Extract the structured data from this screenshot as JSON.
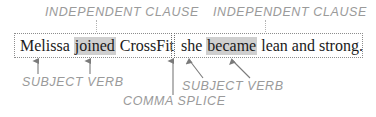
{
  "diagram": {
    "accent_color": "#9a9a9a",
    "highlight_color": "#cfcfcf",
    "text_color": "#1a1a1a"
  },
  "labels": {
    "independent_clause_left": "INDEPENDENT CLAUSE",
    "independent_clause_right": "INDEPENDENT CLAUSE",
    "subject_verb_left": "SUBJECT VERB",
    "subject_verb_right": "SUBJECT VERB",
    "comma_splice": "COMMA SPLICE"
  },
  "sentence": {
    "clause_left": {
      "subject": "Melissa",
      "verb": "joined",
      "rest": "CrossFit",
      "full": "Melissa joined CrossFit"
    },
    "clause_right": {
      "subject": "she",
      "verb": "became",
      "rest": "lean and strong.",
      "full": "she became lean and strong."
    }
  }
}
